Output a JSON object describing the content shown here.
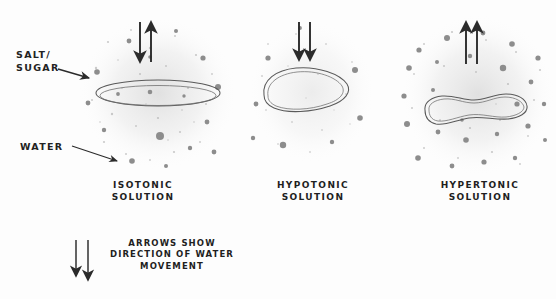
{
  "figure": {
    "style": "hand-drawn pencil sketch",
    "background_color": "#fdfdfd",
    "ink_color": "#232323",
    "particle_color": "#8a8a8a",
    "cell_outline_color": "#555555"
  },
  "annotations": {
    "salt_sugar": {
      "line1": "SALT/",
      "line2": "SUGAR",
      "pointer": "arrow-pointing-right-to-solute-particle"
    },
    "water": {
      "line1": "WATER",
      "pointer": "arrow-pointing-down-right-to-water-speckle"
    }
  },
  "panels": [
    {
      "id": "isotonic",
      "caption_line1": "ISOTONIC",
      "caption_line2": "SOLUTION",
      "cell_shape": "flat-ellipse-normal",
      "solute_density": "medium",
      "arrows": [
        {
          "direction": "down",
          "meaning": "water entering cell"
        },
        {
          "direction": "up",
          "meaning": "water leaving cell"
        }
      ],
      "arrow_summary": "equal water movement in and out"
    },
    {
      "id": "hypotonic",
      "caption_line1": "HYPOTONIC",
      "caption_line2": "SOLUTION",
      "cell_shape": "swollen-round",
      "solute_density": "low",
      "arrows": [
        {
          "direction": "down",
          "meaning": "water entering cell"
        },
        {
          "direction": "down",
          "meaning": "water entering cell"
        }
      ],
      "arrow_summary": "net water movement into cell"
    },
    {
      "id": "hypertonic",
      "caption_line1": "HYPERTONIC",
      "caption_line2": "SOLUTION",
      "cell_shape": "shriveled-crenated",
      "solute_density": "high",
      "arrows": [
        {
          "direction": "up",
          "meaning": "water leaving cell"
        },
        {
          "direction": "up",
          "meaning": "water leaving cell"
        }
      ],
      "arrow_summary": "net water movement out of cell"
    }
  ],
  "legend": {
    "line1": "ARROWS SHOW",
    "line2": "DIRECTION OF WATER",
    "line3": "MOVEMENT",
    "arrows": [
      {
        "direction": "down"
      },
      {
        "direction": "down"
      }
    ]
  }
}
